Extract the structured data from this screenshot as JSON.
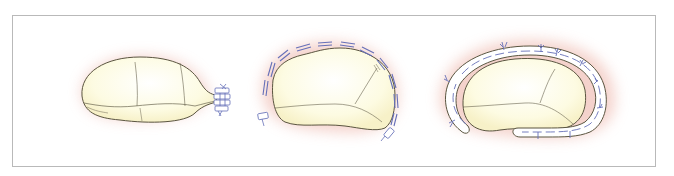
{
  "figure": {
    "panel_count": 3,
    "panels": [
      {
        "id": "panel-1",
        "description": "valve leaflet with commissural plication sutures"
      },
      {
        "id": "panel-2",
        "description": "valve with circumferential pledgeted sutures"
      },
      {
        "id": "panel-3",
        "description": "valve with annuloplasty ring sewn in"
      }
    ],
    "colors": {
      "frame_border": "#b9b9b9",
      "leaflet_fill": "#fdfbe0",
      "leaflet_outline": "#5a5540",
      "tissue_halo": "#f2c8c0",
      "suture": "#6670b8",
      "ring_fill": "#ffffff"
    }
  }
}
